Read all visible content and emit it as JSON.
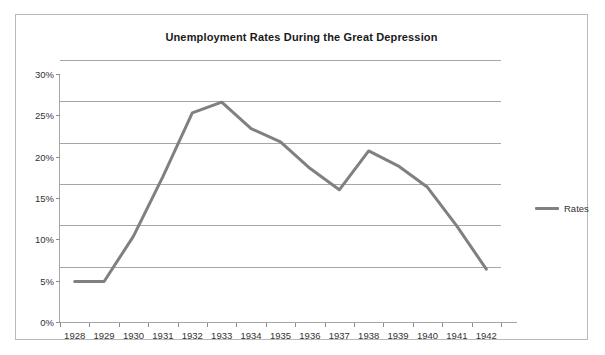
{
  "chart_data": {
    "type": "line",
    "title": "Unemployment Rates During the Great Depression",
    "xlabel": "",
    "ylabel": "",
    "categories": [
      "1928",
      "1929",
      "1930",
      "1931",
      "1932",
      "1933",
      "1934",
      "1935",
      "1936",
      "1937",
      "1938",
      "1939",
      "1940",
      "1941",
      "1942"
    ],
    "series": [
      {
        "name": "Rates",
        "color": "#808080",
        "values": [
          3.2,
          3.2,
          8.7,
          15.9,
          23.6,
          24.9,
          21.7,
          20.1,
          16.9,
          14.3,
          19.0,
          17.2,
          14.6,
          9.9,
          4.7
        ]
      }
    ],
    "ylim": [
      0,
      30
    ],
    "ytick_values": [
      0,
      5,
      10,
      15,
      20,
      25,
      30
    ],
    "ytick_labels": [
      "0%",
      "5%",
      "10%",
      "15%",
      "20%",
      "25%",
      "30%"
    ],
    "grid": true,
    "legend_position": "right"
  },
  "legend": {
    "entries": [
      {
        "label": "Rates",
        "color": "#808080"
      }
    ]
  },
  "colors": {
    "series": "#808080",
    "gridline": "#a6a6a6",
    "axis": "#a6a6a6",
    "frame": "#b9b9b9",
    "text": "#333333",
    "title": "#1a1a1a",
    "background": "#ffffff"
  }
}
